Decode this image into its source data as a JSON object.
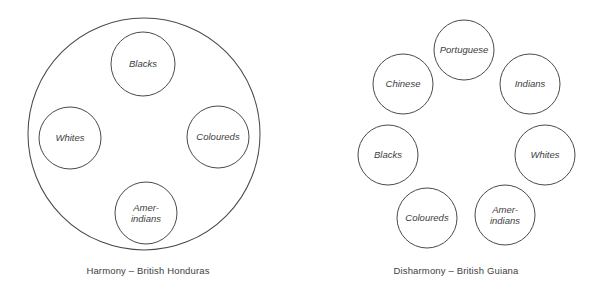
{
  "figure": {
    "background_color": "#ffffff",
    "stroke_color": "#4a4a4a",
    "text_color": "#404040",
    "panels": [
      {
        "id": "harmony",
        "caption": "Harmony – British Honduras",
        "caption_x": 148,
        "caption_y": 271,
        "container": {
          "label": "enclosing-society-circle",
          "cx": 144,
          "cy": 134,
          "r": 116
        },
        "groups": [
          {
            "name": "Blacks",
            "lines": [
              "Blacks"
            ],
            "cx": 143,
            "cy": 64,
            "r": 32
          },
          {
            "name": "Whites",
            "lines": [
              "Whites"
            ],
            "cx": 70,
            "cy": 138,
            "r": 31
          },
          {
            "name": "Coloureds",
            "lines": [
              "Coloureds"
            ],
            "cx": 218,
            "cy": 137,
            "r": 31
          },
          {
            "name": "Amer-indians",
            "lines": [
              "Amer-",
              "indians"
            ],
            "cx": 146,
            "cy": 213,
            "r": 31
          }
        ]
      },
      {
        "id": "disharmony",
        "caption": "Disharmony – British Guiana",
        "caption_x": 456,
        "caption_y": 271,
        "container": null,
        "groups": [
          {
            "name": "Portuguese",
            "lines": [
              "Portuguese"
            ],
            "cx": 464,
            "cy": 50,
            "r": 30
          },
          {
            "name": "Chinese",
            "lines": [
              "Chinese"
            ],
            "cx": 403,
            "cy": 84,
            "r": 30
          },
          {
            "name": "Indians",
            "lines": [
              "Indians"
            ],
            "cx": 530,
            "cy": 84,
            "r": 30
          },
          {
            "name": "Blacks",
            "lines": [
              "Blacks"
            ],
            "cx": 388,
            "cy": 155,
            "r": 30
          },
          {
            "name": "Whites",
            "lines": [
              "Whites"
            ],
            "cx": 545,
            "cy": 155,
            "r": 30
          },
          {
            "name": "Coloureds",
            "lines": [
              "Coloureds"
            ],
            "cx": 427,
            "cy": 218,
            "r": 30
          },
          {
            "name": "Amer-indians",
            "lines": [
              "Amer-",
              "indians"
            ],
            "cx": 505,
            "cy": 215,
            "r": 30
          }
        ]
      }
    ]
  }
}
